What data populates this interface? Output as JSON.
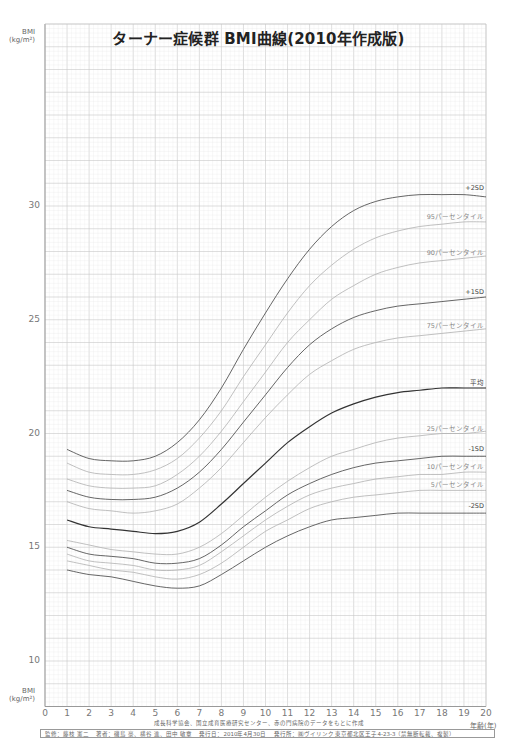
{
  "title": "ターナー症候群 BMI曲線(2010年作成版)",
  "y_axis_label_top": {
    "line1": "BMI",
    "line2": "(kg/m²)"
  },
  "y_axis_label_bottom": {
    "line1": "BMI",
    "line2": "(kg/m²)"
  },
  "x_axis_label": "年齢(年)",
  "source_note": "成長科学協会、国立成育医療研究センター、赤の門病院のデータをもとに作成",
  "footer": "監修：藤枝 憲二　 著者：磯島 豪、横谷 進、田中 敏章　 発行日：2010年4月30日　 発行所：㈱ヴイリンク 東京都北区王子4-23-3（禁無断転載、複製）",
  "colors": {
    "grid_minor": "#e6e6e6",
    "grid_major": "#c8c8c8",
    "axis": "#999999",
    "sd_curve": "#555555",
    "mean_curve": "#333333",
    "percentile_curve": "#b0b0b0"
  },
  "chart_data": {
    "type": "line",
    "title": "ターナー症候群 BMI曲線(2010年作成版)",
    "xlabel": "年齢(年)",
    "ylabel": "BMI (kg/m²)",
    "xlim": [
      0,
      20
    ],
    "ylim": [
      8,
      38
    ],
    "x_ticks": [
      0,
      1,
      2,
      3,
      4,
      5,
      6,
      7,
      8,
      9,
      10,
      11,
      12,
      13,
      14,
      15,
      16,
      17,
      18,
      19,
      20
    ],
    "y_ticks": [
      10,
      15,
      20,
      25,
      30
    ],
    "grid": true,
    "x": [
      1,
      2,
      3,
      4,
      5,
      6,
      7,
      8,
      9,
      10,
      11,
      12,
      13,
      14,
      15,
      16,
      17,
      18,
      19,
      20
    ],
    "series": [
      {
        "name": "+2SD",
        "style": "sd",
        "values": [
          19.3,
          18.9,
          18.8,
          18.8,
          19.0,
          19.6,
          20.6,
          22.0,
          23.7,
          25.3,
          26.8,
          28.1,
          29.1,
          29.8,
          30.2,
          30.4,
          30.5,
          30.5,
          30.5,
          30.4
        ]
      },
      {
        "name": "95パーセンタイル",
        "style": "pct",
        "values": [
          18.7,
          18.3,
          18.2,
          18.2,
          18.4,
          18.9,
          19.8,
          21.0,
          22.5,
          23.9,
          25.3,
          26.5,
          27.4,
          28.1,
          28.6,
          28.9,
          29.1,
          29.2,
          29.3,
          29.3
        ]
      },
      {
        "name": "90パーセンタイル",
        "style": "pct",
        "values": [
          18.0,
          17.7,
          17.6,
          17.6,
          17.7,
          18.2,
          19.0,
          20.1,
          21.4,
          22.7,
          24.0,
          25.0,
          25.9,
          26.5,
          27.0,
          27.3,
          27.5,
          27.6,
          27.7,
          27.8
        ]
      },
      {
        "name": "+1SD",
        "style": "sd",
        "values": [
          17.5,
          17.2,
          17.1,
          17.1,
          17.2,
          17.6,
          18.3,
          19.3,
          20.5,
          21.7,
          22.9,
          23.9,
          24.6,
          25.1,
          25.4,
          25.6,
          25.7,
          25.8,
          25.9,
          26.0
        ]
      },
      {
        "name": "75パーセンタイル",
        "style": "pct",
        "values": [
          17.0,
          16.7,
          16.6,
          16.5,
          16.6,
          16.9,
          17.6,
          18.5,
          19.6,
          20.7,
          21.7,
          22.6,
          23.2,
          23.7,
          24.0,
          24.2,
          24.3,
          24.4,
          24.5,
          24.6
        ]
      },
      {
        "name": "平均",
        "style": "mean",
        "values": [
          16.2,
          15.9,
          15.8,
          15.7,
          15.6,
          15.7,
          16.1,
          16.9,
          17.8,
          18.7,
          19.6,
          20.3,
          20.9,
          21.3,
          21.6,
          21.8,
          21.9,
          22.0,
          22.0,
          22.0
        ]
      },
      {
        "name": "25パーセンタイル",
        "style": "pct",
        "values": [
          15.3,
          15.1,
          14.9,
          14.8,
          14.7,
          14.7,
          15.0,
          15.6,
          16.4,
          17.2,
          17.9,
          18.5,
          19.0,
          19.3,
          19.6,
          19.8,
          19.9,
          20.0,
          20.0,
          20.1
        ]
      },
      {
        "name": "-1SD",
        "style": "sd",
        "values": [
          15.0,
          14.7,
          14.6,
          14.5,
          14.3,
          14.3,
          14.5,
          15.1,
          15.9,
          16.6,
          17.3,
          17.8,
          18.2,
          18.5,
          18.7,
          18.8,
          18.9,
          19.0,
          19.0,
          19.0
        ]
      },
      {
        "name": "10パーセンタイル",
        "style": "pct",
        "values": [
          14.7,
          14.4,
          14.3,
          14.2,
          14.0,
          14.0,
          14.2,
          14.8,
          15.5,
          16.2,
          16.8,
          17.3,
          17.6,
          17.8,
          18.0,
          18.1,
          18.2,
          18.2,
          18.3,
          18.3
        ]
      },
      {
        "name": "5パーセンタイル",
        "style": "pct",
        "values": [
          14.4,
          14.2,
          14.0,
          13.9,
          13.7,
          13.6,
          13.8,
          14.3,
          15.0,
          15.7,
          16.2,
          16.7,
          17.0,
          17.2,
          17.3,
          17.4,
          17.5,
          17.5,
          17.5,
          17.5
        ]
      },
      {
        "name": "-2SD",
        "style": "sd",
        "values": [
          14.0,
          13.8,
          13.7,
          13.5,
          13.3,
          13.2,
          13.3,
          13.8,
          14.4,
          15.0,
          15.5,
          15.9,
          16.2,
          16.3,
          16.4,
          16.5,
          16.5,
          16.5,
          16.5,
          16.5
        ]
      }
    ],
    "annotations": [
      {
        "text": "+2SD",
        "series": "+2SD"
      },
      {
        "text": "95パーセンタイル",
        "series": "95パーセンタイル"
      },
      {
        "text": "90パーセンタイル",
        "series": "90パーセンタイル"
      },
      {
        "text": "+1SD",
        "series": "+1SD"
      },
      {
        "text": "75パーセンタイル",
        "series": "75パーセンタイル"
      },
      {
        "text": "平均",
        "series": "平均"
      },
      {
        "text": "25パーセンタイル",
        "series": "25パーセンタイル"
      },
      {
        "text": "-1SD",
        "series": "-1SD"
      },
      {
        "text": "10パーセンタイル",
        "series": "10パーセンタイル"
      },
      {
        "text": "5パーセンタイル",
        "series": "5パーセンタイル"
      },
      {
        "text": "-2SD",
        "series": "-2SD"
      }
    ],
    "legend": "inline labels at right end of curves"
  }
}
